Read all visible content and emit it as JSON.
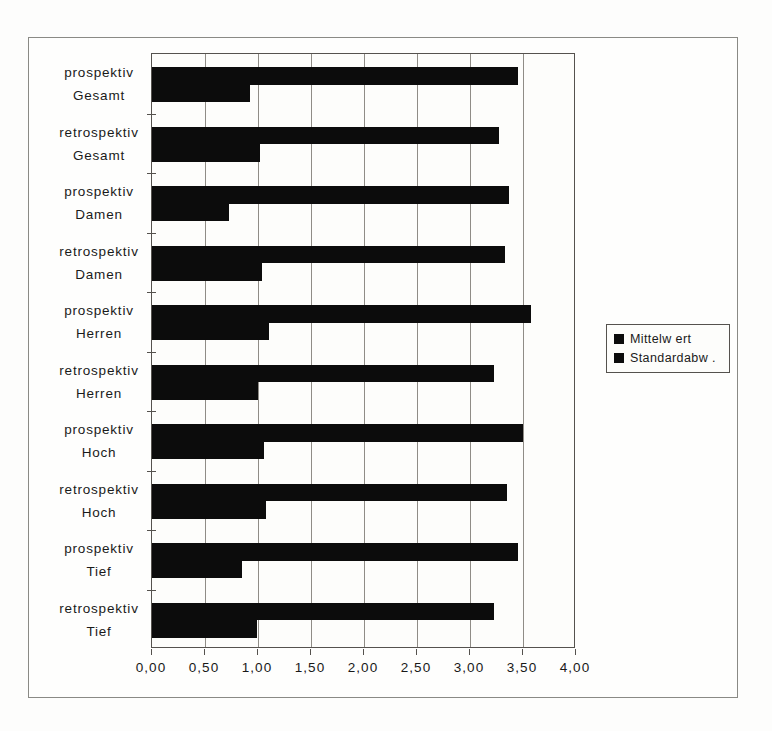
{
  "page": {
    "background": "#fdfdfc",
    "frame_border": "#8a8a85"
  },
  "chart_data": {
    "type": "bar",
    "orientation": "horizontal",
    "title": "",
    "categories": [
      "prospektiv Gesamt",
      "retrospektiv Gesamt",
      "prospektiv Damen",
      "retrospektiv Damen",
      "prospektiv Herren",
      "retrospektiv Herren",
      "prospektiv Hoch",
      "retrospektiv Hoch",
      "prospektiv Tief",
      "retrospektiv Tief"
    ],
    "series": [
      {
        "name": "Mittelw ert",
        "values": [
          3.45,
          3.27,
          3.37,
          3.33,
          3.58,
          3.23,
          3.5,
          3.35,
          3.45,
          3.23
        ]
      },
      {
        "name": "Standardabw .",
        "values": [
          0.92,
          1.02,
          0.73,
          1.04,
          1.1,
          1.0,
          1.06,
          1.08,
          0.85,
          0.99
        ]
      }
    ],
    "xlim": [
      0,
      4
    ],
    "x_tick_values": [
      0,
      0.5,
      1,
      1.5,
      2,
      2.5,
      3,
      3.5,
      4
    ],
    "x_tick_labels": [
      "0,00",
      "0,50",
      "1,00",
      "1,50",
      "2,00",
      "2,50",
      "3,00",
      "3,50",
      "4,00"
    ],
    "grid": true,
    "legend_position": "right",
    "bar_color": "#0c0c0c",
    "grid_color": "#8f8c86"
  }
}
